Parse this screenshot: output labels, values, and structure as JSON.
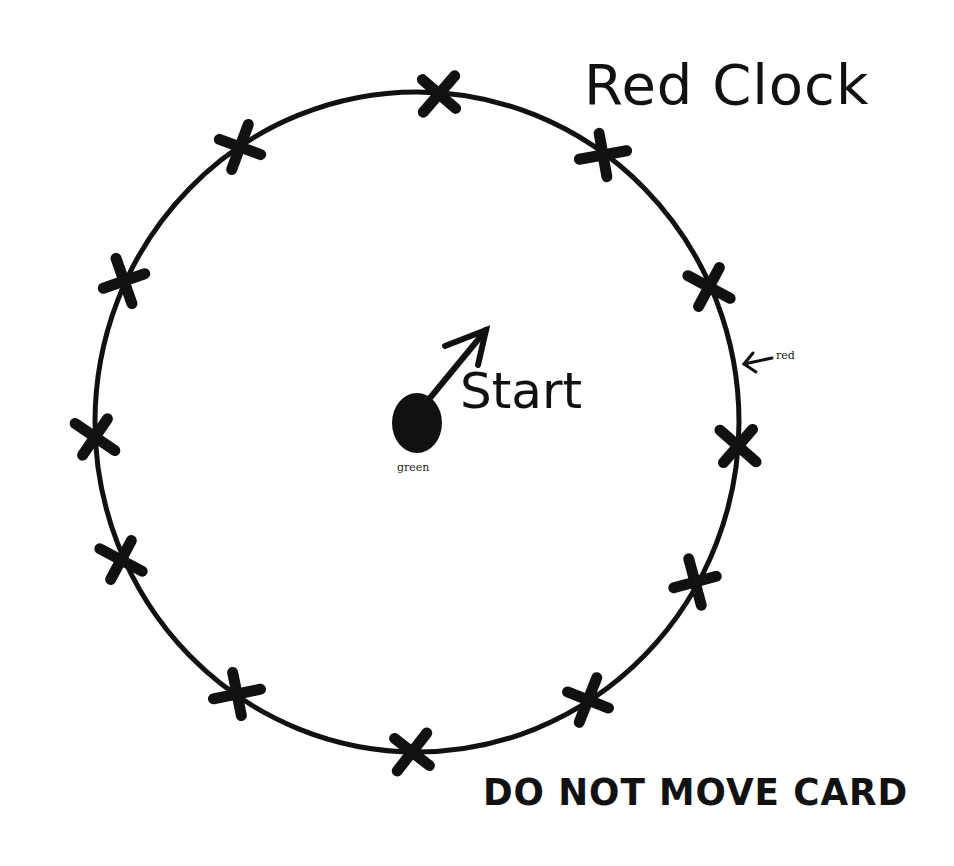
{
  "title": "Red Clock",
  "start_label": "Start",
  "marker_labels": {
    "red": "red",
    "green": "green"
  },
  "footer": "DO NOT MOVE CARD",
  "clock": {
    "center": [
      417,
      422
    ],
    "radius_x": 322,
    "radius_y": 330,
    "mark_count": 12,
    "mark_symbol": "X",
    "marks": [
      [
        439,
        94
      ],
      [
        603,
        155
      ],
      [
        709,
        287
      ],
      [
        738,
        446
      ],
      [
        695,
        582
      ],
      [
        588,
        700
      ],
      [
        412,
        752
      ],
      [
        237,
        694
      ],
      [
        121,
        560
      ],
      [
        95,
        437
      ],
      [
        124,
        281
      ],
      [
        240,
        147
      ]
    ]
  },
  "start_dot": {
    "center": [
      417,
      422
    ],
    "color": "#000000"
  },
  "colors": {
    "ink": "#111111",
    "background": "#ffffff"
  }
}
